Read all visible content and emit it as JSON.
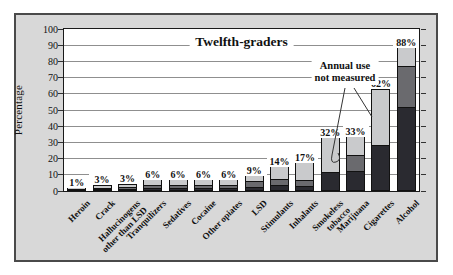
{
  "chart_data": {
    "type": "bar",
    "stacked": true,
    "title": "Twelfth-graders",
    "ylabel": "Percentage",
    "ylim": [
      0,
      100
    ],
    "y_ticks": [
      0,
      10,
      20,
      30,
      40,
      50,
      60,
      70,
      80,
      90,
      100
    ],
    "grid": true,
    "annotation": "Annual use\nnot measured",
    "annotation_targets": [
      "Smokeless tobacco",
      "Cigarettes"
    ],
    "segment_meaning": {
      "dark": "30-day use",
      "medium": "annual use",
      "light": "lifetime use (bar total, labeled)"
    },
    "categories": [
      "Heroin",
      "Crack",
      "Hallucinogens\nother than LSD",
      "Tranquilizers",
      "Sedatives",
      "Cocaine",
      "Other opiates",
      "LSD",
      "Stimulants",
      "Inhalants",
      "Smokeless\ntobacco",
      "Marijuana",
      "Cigarettes",
      "Alcohol"
    ],
    "bars": [
      {
        "label": "Heroin",
        "value_label": "1%",
        "lifetime": 1.2,
        "annual": 0.6,
        "thirty_day": 0.3
      },
      {
        "label": "Crack",
        "value_label": "3%",
        "lifetime": 2.6,
        "annual": 1.5,
        "thirty_day": 0.6
      },
      {
        "label": "Hallucinogens\nother than LSD",
        "value_label": "3%",
        "lifetime": 3.3,
        "annual": 1.7,
        "thirty_day": 0.5
      },
      {
        "label": "Tranquilizers",
        "value_label": "6%",
        "lifetime": 6.0,
        "annual": 2.8,
        "thirty_day": 1.0
      },
      {
        "label": "Sedatives",
        "value_label": "6%",
        "lifetime": 6.1,
        "annual": 2.9,
        "thirty_day": 1.2
      },
      {
        "label": "Cocaine",
        "value_label": "6%",
        "lifetime": 6.1,
        "annual": 3.1,
        "thirty_day": 1.3
      },
      {
        "label": "Other opiates",
        "value_label": "6%",
        "lifetime": 6.1,
        "annual": 3.3,
        "thirty_day": 1.2
      },
      {
        "label": "LSD",
        "value_label": "9%",
        "lifetime": 8.6,
        "annual": 5.6,
        "thirty_day": 2.0
      },
      {
        "label": "Stimulants",
        "value_label": "14%",
        "lifetime": 13.9,
        "annual": 7.1,
        "thirty_day": 2.8
      },
      {
        "label": "Inhalants",
        "value_label": "17%",
        "lifetime": 16.6,
        "annual": 6.2,
        "thirty_day": 2.3
      },
      {
        "label": "Smokeless\ntobacco",
        "value_label": "32%",
        "lifetime": 32.0,
        "annual": null,
        "thirty_day": 11.4
      },
      {
        "label": "Marijuana",
        "value_label": "33%",
        "lifetime": 32.6,
        "annual": 21.9,
        "thirty_day": 11.9
      },
      {
        "label": "Cigarettes",
        "value_label": "62%",
        "lifetime": 61.8,
        "annual": null,
        "thirty_day": 27.8
      },
      {
        "label": "Alcohol",
        "value_label": "88%",
        "lifetime": 87.5,
        "annual": 76.8,
        "thirty_day": 51.3
      }
    ],
    "colors": {
      "lifetime": "#c9cacc",
      "annual": "#6a6a6e",
      "thirty_day": "#2a2a30",
      "figure_bg": "#d8d8d8",
      "plot_bg": "#ffffff",
      "grid": "#8f8f8f",
      "outline": "#111111"
    }
  }
}
